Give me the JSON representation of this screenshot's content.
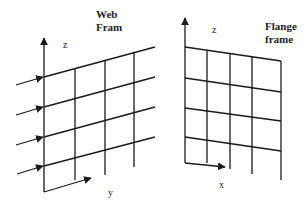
{
  "diagram": {
    "type": "two coordinate frames with grid surfaces",
    "line_color": "#1a1a1a",
    "web_frame": {
      "title_lines": [
        "Web",
        "Fram"
      ],
      "vertical_axis_label": "z",
      "horizontal_axis_label": "y",
      "grid_rows": 4,
      "grid_columns": 4,
      "incoming_arrows": 4
    },
    "flange_frame": {
      "title_lines": [
        "Flange",
        "frame"
      ],
      "vertical_axis_label": "z",
      "horizontal_axis_label": "x",
      "grid_rows": 4,
      "grid_columns": 4
    }
  }
}
